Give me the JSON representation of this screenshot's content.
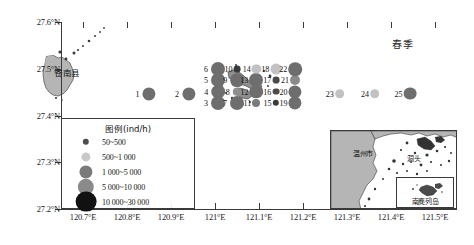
{
  "figure": {
    "season_label": "春季",
    "county_label": "苍南县"
  },
  "axes": {
    "y_ticks": [
      "27.6°N",
      "27.5°N",
      "27.4°N",
      "27.3°N",
      "27.2°N"
    ],
    "y_values": [
      27.6,
      27.5,
      27.4,
      27.3,
      27.2
    ],
    "x_ticks": [
      "120.7°E",
      "120.8°E",
      "120.9°E",
      "121°E",
      "121.1°E",
      "121.2°E",
      "121.3°E",
      "121.4°E",
      "121.5°E"
    ],
    "x_values": [
      120.7,
      120.8,
      120.9,
      121.0,
      121.1,
      121.2,
      121.3,
      121.4,
      121.5
    ],
    "xlim": [
      120.65,
      121.55
    ],
    "ylim": [
      27.2,
      27.6
    ]
  },
  "legend": {
    "title": "图例(ind/h)",
    "entries": [
      {
        "label": "50~500",
        "size": 3.2,
        "color": "#4d4d4d"
      },
      {
        "label": "500~1 000",
        "size": 4.6,
        "color": "#c8c8c8"
      },
      {
        "label": "1 000~5 000",
        "size": 6.6,
        "color": "#7a7a7a"
      },
      {
        "label": "5 000~10 000",
        "size": 8.2,
        "color": "#8a8a8a"
      },
      {
        "label": "10 000~30 000",
        "size": 10.4,
        "color": "#111111"
      }
    ]
  },
  "inset": {
    "labels": [
      {
        "text": "温州市",
        "x": 22,
        "y": 17
      },
      {
        "text": "洞头",
        "x": 76,
        "y": 22
      }
    ],
    "nanji_label": "南麂列岛"
  },
  "chart_data": {
    "type": "scatter",
    "title": "春季",
    "xlabel": "",
    "ylabel": "",
    "xlim": [
      120.65,
      121.55
    ],
    "ylim": [
      27.2,
      27.6
    ],
    "grid": false,
    "size_legend_units": "ind/h",
    "size_classes": [
      "50~500",
      "500~1 000",
      "1 000~5 000",
      "5 000~10 000",
      "10 000~30 000"
    ],
    "points": [
      {
        "station": "1",
        "x": 120.85,
        "y": 27.447,
        "size": 6.6,
        "color": "#6e6e6e",
        "class": "1 000~5 000"
      },
      {
        "station": "2",
        "x": 120.94,
        "y": 27.447,
        "size": 6.6,
        "color": "#6e6e6e",
        "class": "1 000~5 000"
      },
      {
        "station": "3",
        "x": 121.007,
        "y": 27.427,
        "size": 7.0,
        "color": "#6e6e6e",
        "class": "1 000~5 000"
      },
      {
        "station": "4",
        "x": 121.007,
        "y": 27.451,
        "size": 6.8,
        "color": "#6e6e6e",
        "class": "1 000~5 000"
      },
      {
        "station": "5",
        "x": 121.007,
        "y": 27.476,
        "size": 7.0,
        "color": "#6e6e6e",
        "class": "1 000~5 000"
      },
      {
        "station": "6",
        "x": 121.007,
        "y": 27.499,
        "size": 7.0,
        "color": "#6e6e6e",
        "class": "1 000~5 000"
      },
      {
        "station": "7",
        "x": 121.05,
        "y": 27.427,
        "size": 7.0,
        "color": "#6e6e6e",
        "class": "1 000~5 000"
      },
      {
        "station": "8",
        "x": 121.05,
        "y": 27.451,
        "size": 4.2,
        "color": "#8f8f8f",
        "class": "500~1 000"
      },
      {
        "station": "9",
        "x": 121.05,
        "y": 27.476,
        "size": 6.8,
        "color": "#6e6e6e",
        "class": "1 000~5 000"
      },
      {
        "station": "10",
        "x": 121.05,
        "y": 27.499,
        "size": 3.4,
        "color": "#3a3a3a",
        "class": "50~500"
      },
      {
        "station": "11",
        "x": 121.094,
        "y": 27.427,
        "size": 4.0,
        "color": "#7a7a7a",
        "class": "500~1 000"
      },
      {
        "station": "12",
        "x": 121.094,
        "y": 27.451,
        "size": 6.8,
        "color": "#6e6e6e",
        "class": "1 000~5 000"
      },
      {
        "station": "13",
        "x": 121.094,
        "y": 27.476,
        "size": 7.0,
        "color": "#6e6e6e",
        "class": "1 000~5 000"
      },
      {
        "station": "14",
        "x": 121.094,
        "y": 27.499,
        "size": 4.6,
        "color": "#c2c2c2",
        "class": "500~1 000"
      },
      {
        "station": "15",
        "x": 121.138,
        "y": 27.427,
        "size": 3.2,
        "color": "#3a3a3a",
        "class": "50~500"
      },
      {
        "station": "16",
        "x": 121.138,
        "y": 27.451,
        "size": 3.4,
        "color": "#4a4a4a",
        "class": "50~500"
      },
      {
        "station": "17",
        "x": 121.138,
        "y": 27.476,
        "size": 3.4,
        "color": "#4a4a4a",
        "class": "50~500"
      },
      {
        "station": "18",
        "x": 121.138,
        "y": 27.499,
        "size": 5.4,
        "color": "#c2c2c2",
        "class": "500~1 000"
      },
      {
        "station": "19",
        "x": 121.182,
        "y": 27.427,
        "size": 6.6,
        "color": "#6e6e6e",
        "class": "1 000~5 000"
      },
      {
        "station": "20",
        "x": 121.182,
        "y": 27.451,
        "size": 6.6,
        "color": "#6e6e6e",
        "class": "1 000~5 000"
      },
      {
        "station": "21",
        "x": 121.182,
        "y": 27.476,
        "size": 5.0,
        "color": "#8a8a8a",
        "class": "500~1 000"
      },
      {
        "station": "22",
        "x": 121.182,
        "y": 27.499,
        "size": 6.8,
        "color": "#6e6e6e",
        "class": "1 000~5 000"
      },
      {
        "station": "23",
        "x": 121.283,
        "y": 27.447,
        "size": 4.8,
        "color": "#c2c2c2",
        "class": "500~1 000"
      },
      {
        "station": "24",
        "x": 121.363,
        "y": 27.447,
        "size": 4.8,
        "color": "#c2c2c2",
        "class": "500~1 000"
      },
      {
        "station": "25",
        "x": 121.443,
        "y": 27.447,
        "size": 6.4,
        "color": "#6e6e6e",
        "class": "1 000~5 000"
      }
    ],
    "label_offsets": {
      "1": "left",
      "2": "left",
      "3": "left",
      "4": "left",
      "5": "left",
      "6": "left",
      "7": "left",
      "8": "left",
      "9": "left",
      "10": "left",
      "11": "left",
      "12": "left",
      "13": "left",
      "14": "left",
      "15": "left",
      "16": "left",
      "17": "left",
      "18": "left",
      "19": "left",
      "20": "left",
      "21": "left",
      "22": "left",
      "23": "left",
      "24": "left",
      "25": "left"
    }
  }
}
